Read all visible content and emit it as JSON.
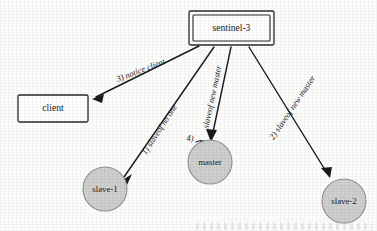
{
  "diagram": {
    "background_color": "#fdfdfc",
    "line_color": "#1a1a1a",
    "circle_fill_color": "#cfcfcf",
    "circle_stroke_color": "#8f8f8f",
    "box_stroke_color": "#2a2a2a",
    "type": "node-edge-diagram"
  },
  "nodes": {
    "sentinel": {
      "label": "sentinel-3",
      "shape": "double-rectangle",
      "x": 189,
      "y": 11,
      "width": 85,
      "height": 34
    },
    "client": {
      "label": "client",
      "shape": "rectangle",
      "x": 18,
      "y": 95,
      "width": 70,
      "height": 27
    },
    "slave1": {
      "label": "slave-1",
      "shape": "circle",
      "cx": 105,
      "cy": 189,
      "r": 22
    },
    "master": {
      "label": "master",
      "shape": "circle",
      "cx": 210,
      "cy": 162,
      "r": 22
    },
    "slave2": {
      "label": "slave-2",
      "shape": "circle",
      "cx": 344,
      "cy": 201,
      "r": 22
    }
  },
  "edges": [
    {
      "id": "edge-notice-client",
      "from": "sentinel",
      "to": "client",
      "step": "3)",
      "label": "notice client",
      "full_label": "3)  notice client",
      "label_angle": -21
    },
    {
      "id": "edge-slaveof-no-one",
      "from": "sentinel",
      "to": "slave1",
      "step": "1)",
      "label": "slaveof no one",
      "full_label": "1)  slaveof no one",
      "label_angle": -57
    },
    {
      "id": "edge-slaveof-new-master-to-master",
      "from": "sentinel",
      "to": "master",
      "step": "4)",
      "label": "slaveof new master",
      "full_label": "slaveof new master",
      "label_angle": -78
    },
    {
      "id": "edge-slaveof-new-master-to-slave2",
      "from": "sentinel",
      "to": "slave2",
      "step": "2)",
      "label": "slaveof new master",
      "full_label": "2)  slaveof new master",
      "label_angle": -56
    }
  ],
  "annotations": {
    "master_step_marker": "4)"
  }
}
